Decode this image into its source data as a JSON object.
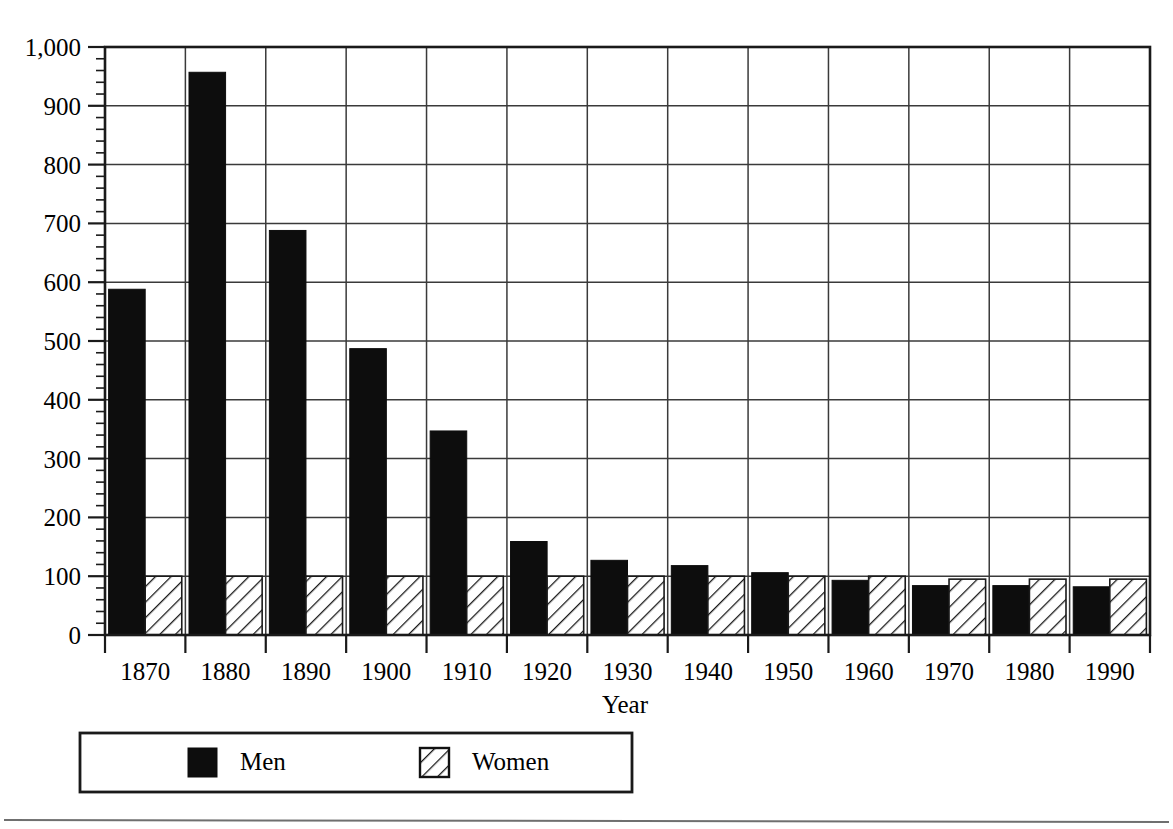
{
  "chart_data": {
    "type": "bar",
    "title": "",
    "subtitle": "",
    "xlabel": "Year",
    "ylabel": "",
    "categories": [
      "1870",
      "1880",
      "1890",
      "1900",
      "1910",
      "1920",
      "1930",
      "1940",
      "1950",
      "1960",
      "1970",
      "1980",
      "1990"
    ],
    "series": [
      {
        "name": "Men",
        "values": [
          588,
          957,
          688,
          487,
          347,
          159,
          127,
          118,
          106,
          93,
          84,
          84,
          82
        ]
      },
      {
        "name": "Women",
        "values": [
          100,
          100,
          100,
          100,
          100,
          100,
          100,
          100,
          100,
          100,
          95,
          95,
          95
        ]
      }
    ],
    "ylim": [
      0,
      1000
    ],
    "ytick_values": [
      0,
      100,
      200,
      300,
      400,
      500,
      600,
      700,
      800,
      900,
      1000
    ],
    "ytick_labels": [
      "0",
      "100",
      "200",
      "300",
      "400",
      "500",
      "600",
      "700",
      "800",
      "900",
      "1,000"
    ],
    "y_minor_tick_step": 20,
    "grid": true,
    "grid_axis": "both",
    "legend_position": "bottom",
    "legend_entries": [
      {
        "label": "Men",
        "swatch": "solid-black"
      },
      {
        "label": "Women",
        "swatch": "diagonal-hatch"
      }
    ]
  },
  "axes": {
    "x_axis_title": "Year",
    "y_axis_title": ""
  },
  "legend": {
    "men_label": "Men",
    "women_label": "Women"
  },
  "colors": {
    "men_fill": "#0d0d0d",
    "women_fill": "#ffffff",
    "women_hatch": "#1a1a1a",
    "frame": "#1a1a1a",
    "grid": "#3a3a3a",
    "background": "#ffffff",
    "page_rule": "#6f6f6f"
  }
}
